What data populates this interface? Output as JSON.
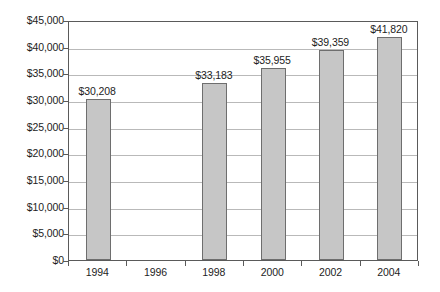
{
  "chart_data": {
    "type": "bar",
    "title": "",
    "subtitle": "",
    "xlabel": "",
    "ylabel": "",
    "categories": [
      "1994",
      "1996",
      "1998",
      "2000",
      "2002",
      "2004"
    ],
    "values": [
      30208,
      null,
      33183,
      35955,
      39359,
      41820
    ],
    "point_labels": [
      "$30,208",
      "",
      "$33,183",
      "$35,955",
      "$39,359",
      "$41,820"
    ],
    "series": [
      {
        "name": "",
        "values": [
          30208,
          null,
          33183,
          35955,
          39359,
          41820
        ]
      }
    ],
    "ylim": [
      0,
      45000
    ],
    "ytick_values": [
      0,
      5000,
      10000,
      15000,
      20000,
      25000,
      30000,
      35000,
      40000,
      45000
    ],
    "ytick_labels": [
      "$45,000",
      "$40,000",
      "$35,000",
      "$30,000",
      "$25,000",
      "$20,000",
      "$15,000",
      "$10,000",
      "$5,000",
      "$0"
    ],
    "grid": true,
    "legend": false,
    "legend_position": "none",
    "bar_color": "#c6c6c6",
    "bar_border_color": "#6e6e6e",
    "gridline_color": "#b9b9b9",
    "axis_color": "#5a5a5a",
    "background_color": "#ffffff",
    "text_color": "#1d1d1d"
  }
}
